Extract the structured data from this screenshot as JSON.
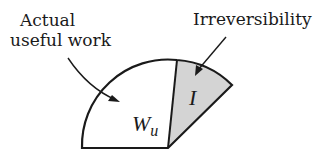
{
  "labels": {
    "actual_line1": "Actual",
    "actual_line2": "useful work",
    "irreversibility": "Irreversibility",
    "wu_main": "W",
    "wu_sub": "u",
    "i_symbol": "I"
  },
  "colors": {
    "stroke": "#1a1a1a",
    "shaded": "#d4d4d4",
    "background": "#ffffff"
  }
}
